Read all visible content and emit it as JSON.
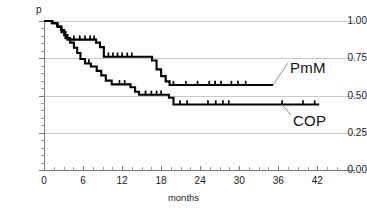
{
  "chart_data": {
    "type": "line",
    "subtype": "kaplan-meier-step",
    "title": "",
    "xlabel": "months",
    "ylabel": "p",
    "xlim": [
      0,
      47.8
    ],
    "ylim": [
      0.0,
      1.0
    ],
    "grid": true,
    "grid_axis": "y",
    "legend_position": "inline-annotation-right",
    "x_ticks": [
      0,
      6,
      12,
      18,
      24,
      30,
      36,
      42
    ],
    "x_tick_labels": [
      "0",
      "6",
      "12",
      "18",
      "24",
      "30",
      "36",
      "42"
    ],
    "x_minor_tick_step": 1.5,
    "y_ticks": [
      0.0,
      0.25,
      0.5,
      0.75,
      1.0
    ],
    "y_tick_labels": [
      "0.00",
      "0.25",
      "0.50",
      "0.75",
      "1.00"
    ],
    "y_minor_tick_step": 0.05,
    "series": [
      {
        "name": "PmM",
        "color": "#000000",
        "plateau_value": 0.57,
        "final_x": 35.2,
        "steps": [
          [
            0.0,
            1.0
          ],
          [
            1.2,
            1.0
          ],
          [
            1.2,
            0.985
          ],
          [
            2.0,
            0.985
          ],
          [
            2.0,
            0.965
          ],
          [
            2.6,
            0.965
          ],
          [
            2.6,
            0.94
          ],
          [
            3.1,
            0.94
          ],
          [
            3.1,
            0.905
          ],
          [
            3.6,
            0.905
          ],
          [
            3.6,
            0.875
          ],
          [
            8.0,
            0.875
          ],
          [
            8.0,
            0.855
          ],
          [
            8.6,
            0.855
          ],
          [
            8.6,
            0.825
          ],
          [
            9.2,
            0.825
          ],
          [
            9.2,
            0.76
          ],
          [
            16.6,
            0.76
          ],
          [
            16.6,
            0.735
          ],
          [
            17.3,
            0.735
          ],
          [
            17.3,
            0.675
          ],
          [
            18.0,
            0.675
          ],
          [
            18.0,
            0.63
          ],
          [
            18.7,
            0.63
          ],
          [
            18.7,
            0.595
          ],
          [
            19.3,
            0.595
          ],
          [
            19.3,
            0.57
          ],
          [
            35.2,
            0.57
          ]
        ],
        "censor_marks": [
          4.6,
          5.5,
          6.3,
          7.1,
          7.7,
          9.9,
          10.6,
          11.3,
          12.0,
          12.8,
          13.5,
          19.9,
          21.8,
          23.6,
          25.4,
          26.3,
          27.2,
          28.8,
          29.8,
          31.0
        ]
      },
      {
        "name": "COP",
        "color": "#000000",
        "plateau_value": 0.44,
        "final_x": 42.3,
        "steps": [
          [
            0.0,
            1.0
          ],
          [
            1.3,
            1.0
          ],
          [
            1.3,
            0.985
          ],
          [
            2.1,
            0.985
          ],
          [
            2.1,
            0.96
          ],
          [
            2.7,
            0.96
          ],
          [
            2.7,
            0.925
          ],
          [
            3.3,
            0.925
          ],
          [
            3.3,
            0.885
          ],
          [
            4.0,
            0.885
          ],
          [
            4.0,
            0.855
          ],
          [
            4.6,
            0.855
          ],
          [
            4.6,
            0.82
          ],
          [
            5.1,
            0.82
          ],
          [
            5.1,
            0.785
          ],
          [
            5.6,
            0.785
          ],
          [
            5.6,
            0.745
          ],
          [
            6.3,
            0.745
          ],
          [
            6.3,
            0.715
          ],
          [
            7.2,
            0.715
          ],
          [
            7.2,
            0.695
          ],
          [
            8.1,
            0.695
          ],
          [
            8.1,
            0.665
          ],
          [
            8.8,
            0.665
          ],
          [
            8.8,
            0.635
          ],
          [
            9.5,
            0.635
          ],
          [
            9.5,
            0.6
          ],
          [
            10.4,
            0.6
          ],
          [
            10.4,
            0.575
          ],
          [
            13.3,
            0.575
          ],
          [
            13.3,
            0.555
          ],
          [
            14.0,
            0.555
          ],
          [
            14.0,
            0.525
          ],
          [
            14.6,
            0.525
          ],
          [
            14.6,
            0.505
          ],
          [
            19.2,
            0.505
          ],
          [
            19.2,
            0.485
          ],
          [
            19.9,
            0.485
          ],
          [
            19.9,
            0.44
          ],
          [
            42.3,
            0.44
          ]
        ],
        "censor_marks": [
          6.9,
          11.6,
          12.4,
          15.6,
          16.5,
          17.3,
          18.0,
          20.9,
          22.0,
          25.2,
          26.4,
          27.5,
          28.4,
          36.6,
          39.8,
          41.6
        ]
      }
    ]
  },
  "annotations": {
    "series_labels": [
      {
        "name": "PmM",
        "text": "PmM"
      },
      {
        "name": "COP",
        "text": "COP"
      }
    ]
  }
}
